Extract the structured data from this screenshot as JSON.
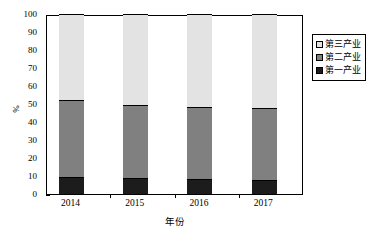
{
  "chart_data": {
    "type": "bar",
    "subtype": "stacked-100-percent",
    "title": "",
    "xlabel": "年份",
    "ylabel": "%",
    "categories": [
      "2014",
      "2015",
      "2016",
      "2017"
    ],
    "ylim": [
      0,
      100
    ],
    "yticks": [
      "0",
      "10",
      "20",
      "30",
      "40",
      "50",
      "60",
      "70",
      "80",
      "90",
      "100"
    ],
    "grid": false,
    "legend_position": "right",
    "series": [
      {
        "name": "第一产业",
        "color": "#1c1c1c",
        "values": [
          9.2,
          8.9,
          8.4,
          7.6
        ]
      },
      {
        "name": "第二产业",
        "color": "#808080",
        "values": [
          43.0,
          40.7,
          39.8,
          40.4
        ]
      },
      {
        "name": "第三产业",
        "color": "#e3e3e3",
        "values": [
          47.8,
          50.4,
          51.8,
          52.0
        ]
      }
    ],
    "cumulative_tops": {
      "primary": [
        9.2,
        8.9,
        8.4,
        7.6
      ],
      "secondary": [
        52.2,
        49.6,
        48.2,
        48.0
      ]
    }
  },
  "legend": {
    "items": [
      {
        "label": "第三产业",
        "color": "#e3e3e3",
        "swatch": "tertiary-swatch"
      },
      {
        "label": "第二产业",
        "color": "#808080",
        "swatch": "secondary-swatch"
      },
      {
        "label": "第一产业",
        "color": "#1c1c1c",
        "swatch": "primary-swatch"
      }
    ]
  }
}
